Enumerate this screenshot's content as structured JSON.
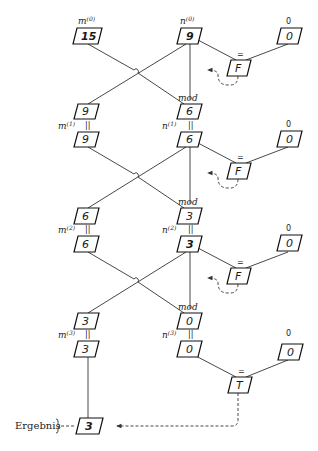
{
  "diagram": {
    "type": "gcd-euclid-dataflow",
    "result_label": "Ergebnis",
    "result_value": "3",
    "mod_label": "mod",
    "eq_label": "=",
    "eq_sym": "||",
    "zero_label": "0",
    "iterations": [
      {
        "m_label": "m",
        "m_sup": "(0)",
        "m_value": "15",
        "n_label": "n",
        "n_sup": "(0)",
        "n_value": "9",
        "zero_value": "0",
        "test": "F"
      },
      {
        "m_label": "m",
        "m_sup": "(1)",
        "m_value": "9",
        "n_label": "n",
        "n_sup": "(1)",
        "n_value": "6",
        "mod_value": "6",
        "prev_n": "9",
        "zero_value": "0",
        "test": "F"
      },
      {
        "m_label": "m",
        "m_sup": "(2)",
        "m_value": "6",
        "n_label": "n",
        "n_sup": "(2)",
        "n_value": "3",
        "mod_value": "3",
        "prev_n": "6",
        "zero_value": "0",
        "test": "F"
      },
      {
        "m_label": "m",
        "m_sup": "(3)",
        "m_value": "3",
        "n_label": "n",
        "n_sup": "(3)",
        "n_value": "0",
        "mod_value": "0",
        "prev_n": "3",
        "zero_value": "0",
        "test": "T"
      }
    ]
  }
}
